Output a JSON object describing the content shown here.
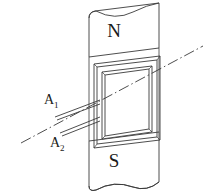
{
  "figure": {
    "title": "",
    "type": "physics-line-diagram",
    "background_color": "#ffffff",
    "stroke_color": "#3a3a3a",
    "text_color": "#1a1a1a",
    "magnet": {
      "north_pole_label": "N",
      "south_pole_label": "S"
    },
    "coil": {
      "shape": "rectangular-frame",
      "turns_rendering": "double-line"
    },
    "leads": [
      {
        "label": "A",
        "subscript": "1"
      },
      {
        "label": "A",
        "subscript": "2"
      }
    ],
    "axis": {
      "style": "dash-dot",
      "description": "rotation axis"
    }
  }
}
